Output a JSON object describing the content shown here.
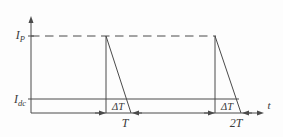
{
  "diagram": {
    "type": "waveform-timing-diagram",
    "colors": {
      "line": "#4a4a4a",
      "text": "#3a3a3a",
      "background": "#fdfdfd"
    },
    "labels": {
      "ip_main": "I",
      "ip_sub": "P",
      "idc_main": "I",
      "idc_sub": "dc",
      "delta_t": "ΔT",
      "period_1": "T",
      "period_2": "2T",
      "time_axis": "t"
    },
    "geometry": {
      "axis_x": 31,
      "axis_y": 113,
      "y_axis_top": 16,
      "t_axis_end": 264,
      "ip_y": 36,
      "ip_line_end_x": 216,
      "ip_dash": "8.5 5.5",
      "idc_y": 99,
      "idc_line_start_x": 28,
      "idc_line_end_x": 239,
      "tick_half": 3,
      "pulses": [
        {
          "x_rise": 106,
          "x_fall_end": 131
        },
        {
          "x_rise": 215,
          "x_fall_end": 241
        }
      ]
    }
  }
}
